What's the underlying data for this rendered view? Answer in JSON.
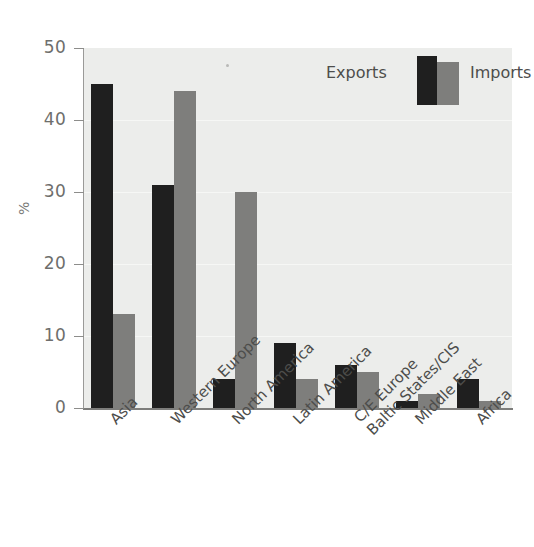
{
  "chart_data": {
    "type": "bar",
    "title": "",
    "xlabel": "",
    "ylabel": "%",
    "ylim": [
      0,
      50
    ],
    "yticks": [
      0,
      10,
      20,
      30,
      40,
      50
    ],
    "ytick_labels": [
      "0",
      "10",
      "20",
      "30",
      "40",
      "50"
    ],
    "grid": true,
    "legend_position": "top-right",
    "categories": [
      "Asia",
      "Western Europe",
      "North America",
      "Latin America",
      "C/E Europe\nBaltic States/CIS",
      "Middle East",
      "Africa"
    ],
    "category_lines": [
      [
        "Asia"
      ],
      [
        "Western Europe"
      ],
      [
        "North America"
      ],
      [
        "Latin America"
      ],
      [
        "C/E Europe",
        "Baltic States/CIS"
      ],
      [
        "Middle East"
      ],
      [
        "Africa"
      ]
    ],
    "series": [
      {
        "name": "Exports",
        "color": "#1f1f1f",
        "values": [
          45,
          31,
          4,
          9,
          6,
          1,
          4
        ]
      },
      {
        "name": "Imports",
        "color": "#7e7e7c",
        "values": [
          13,
          44,
          30,
          4,
          5,
          2,
          1
        ]
      }
    ]
  },
  "legend": {
    "exports_label": "Exports",
    "imports_label": "Imports"
  },
  "axis": {
    "y_title": "%"
  }
}
